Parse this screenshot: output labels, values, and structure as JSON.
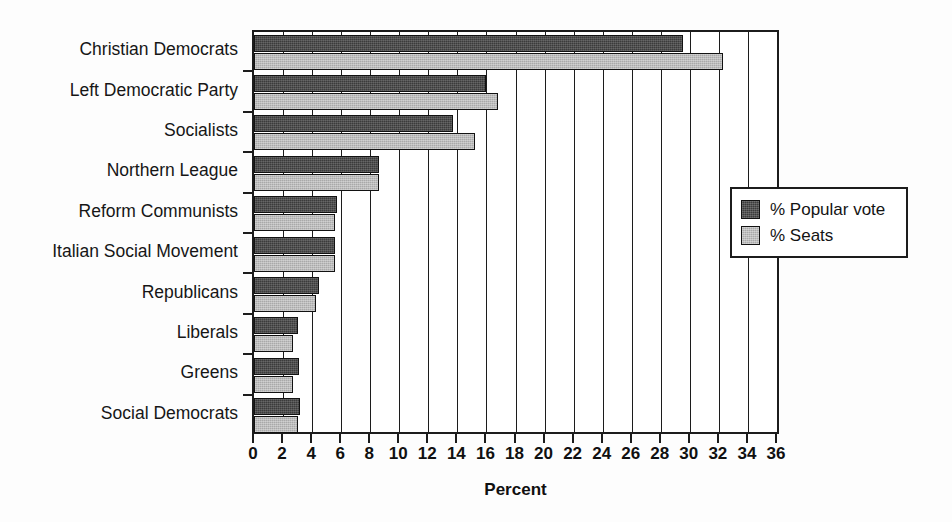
{
  "chart_data": {
    "type": "bar",
    "orientation": "horizontal",
    "title": "",
    "xlabel": "Percent",
    "ylabel": "",
    "xlim": [
      0,
      36
    ],
    "xticks": [
      0,
      2,
      4,
      6,
      8,
      10,
      12,
      14,
      16,
      18,
      20,
      22,
      24,
      26,
      28,
      30,
      32,
      34,
      36
    ],
    "xtick_labels": [
      "0",
      "2",
      "4",
      "6",
      "8",
      "10",
      "12",
      "14",
      "16",
      "18",
      "20",
      "22",
      "24",
      "26",
      "28",
      "30",
      "32",
      "34",
      "36"
    ],
    "grid": true,
    "grid_axis": "x",
    "legend_position": "right",
    "categories": [
      "Christian Democrats",
      "Left Democratic Party",
      "Socialists",
      "Northern League",
      "Reform Communists",
      "Italian Social Movement",
      "Republicans",
      "Liberals",
      "Greens",
      "Social Democrats"
    ],
    "series": [
      {
        "name": "% Popular vote",
        "color": "#3b3b3b",
        "values": [
          29.5,
          16.0,
          13.7,
          8.6,
          5.7,
          5.6,
          4.5,
          3.0,
          3.1,
          3.2
        ]
      },
      {
        "name": "% Seats",
        "color": "#a9a9a9",
        "values": [
          32.3,
          16.8,
          15.2,
          8.6,
          5.6,
          5.6,
          4.3,
          2.7,
          2.7,
          3.0
        ]
      }
    ]
  },
  "legend": {
    "entries": [
      {
        "label": "% Popular vote",
        "swatch_class": "popular"
      },
      {
        "label": "% Seats",
        "swatch_class": "seats"
      }
    ]
  }
}
